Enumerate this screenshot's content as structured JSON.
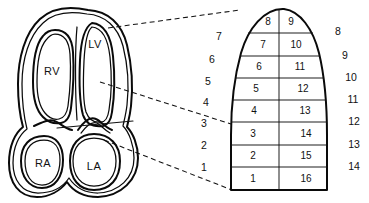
{
  "figure": {
    "ink_color": "#0a0a0a",
    "background_color": "#ffffff"
  },
  "heart": {
    "name": "four-chamber-heart-cross-section",
    "chambers": [
      {
        "id": "rv",
        "label": "RV",
        "x": 52,
        "y": 72,
        "full_name": "right ventricle"
      },
      {
        "id": "lv",
        "label": "LV",
        "x": 93,
        "y": 45,
        "full_name": "left ventricle"
      },
      {
        "id": "ra",
        "label": "RA",
        "x": 44,
        "y": 165,
        "full_name": "right atrium"
      },
      {
        "id": "la",
        "label": "LA",
        "x": 93,
        "y": 168,
        "full_name": "left atrium"
      }
    ]
  },
  "connectors": [
    {
      "id": "apex-connector",
      "x1": 108,
      "y1": 28,
      "x2": 238,
      "y2": 11
    },
    {
      "id": "mid-connector",
      "x1": 100,
      "y1": 82,
      "x2": 231,
      "y2": 124
    },
    {
      "id": "basal-connector",
      "x1": 104,
      "y1": 140,
      "x2": 231,
      "y2": 190
    }
  ],
  "segment_model": {
    "name": "left-ventricle-16-segment-model",
    "rows": 8,
    "columns": 2,
    "total_segments": 16,
    "apex_side": "top",
    "base_side": "bottom",
    "left_column_numbers": [
      "8",
      "7",
      "6",
      "5",
      "4",
      "3",
      "2",
      "1"
    ],
    "right_column_numbers": [
      "9",
      "10",
      "11",
      "12",
      "13",
      "14",
      "15",
      "16"
    ],
    "segments": [
      {
        "row": 1,
        "left": "8",
        "right": "9"
      },
      {
        "row": 2,
        "left": "7",
        "right": "10"
      },
      {
        "row": 3,
        "left": "6",
        "right": "11"
      },
      {
        "row": 4,
        "left": "5",
        "right": "12"
      },
      {
        "row": 5,
        "left": "4",
        "right": "13"
      },
      {
        "row": 6,
        "left": "3",
        "right": "14"
      },
      {
        "row": 7,
        "left": "2",
        "right": "15"
      },
      {
        "row": 8,
        "left": "1",
        "right": "16"
      }
    ]
  },
  "outer_scale": {
    "left_labels": [
      "7",
      "6",
      "5",
      "4",
      "3",
      "2",
      "1"
    ],
    "right_labels": [
      "8",
      "9",
      "10",
      "11",
      "12",
      "13",
      "14"
    ],
    "left_positions": [
      {
        "label": "7",
        "x": 219,
        "y": 37
      },
      {
        "label": "6",
        "x": 211,
        "y": 60
      },
      {
        "label": "5",
        "x": 207,
        "y": 82
      },
      {
        "label": "4",
        "x": 205,
        "y": 103
      },
      {
        "label": "3",
        "x": 203,
        "y": 124
      },
      {
        "label": "2",
        "x": 203,
        "y": 145
      },
      {
        "label": "1",
        "x": 203,
        "y": 167
      }
    ],
    "right_positions": [
      {
        "label": "8",
        "x": 337,
        "y": 32
      },
      {
        "label": "9",
        "x": 345,
        "y": 56
      },
      {
        "label": "10",
        "x": 351,
        "y": 78
      },
      {
        "label": "11",
        "x": 353,
        "y": 100
      },
      {
        "label": "12",
        "x": 354,
        "y": 122
      },
      {
        "label": "13",
        "x": 354,
        "y": 145
      },
      {
        "label": "14",
        "x": 354,
        "y": 167
      }
    ]
  }
}
